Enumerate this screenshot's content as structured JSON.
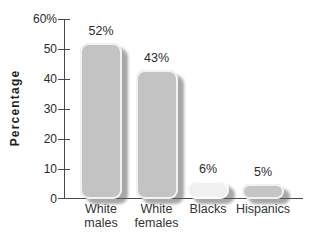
{
  "colors": {
    "background": "#ffffff",
    "bar_fill": "#c3c3c3",
    "bar_fill_light": "#f0f0f0",
    "axis": "#4a4a4a",
    "tick_text": "#2b2b2b",
    "value_text": "#2b2b2b",
    "category_text": "#333333"
  },
  "chart_data": {
    "type": "bar",
    "title": "",
    "xlabel": "",
    "ylabel": "Percentage",
    "categories": [
      "White males",
      "White females",
      "Blacks",
      "Hispanics"
    ],
    "values": [
      52,
      43,
      6,
      5
    ],
    "value_labels": [
      "52%",
      "43%",
      "6%",
      "5%"
    ],
    "ylim": [
      0,
      60
    ],
    "yticks": [
      {
        "value": 60,
        "label": "60%"
      },
      {
        "value": 50,
        "label": "50"
      },
      {
        "value": 40,
        "label": "40"
      },
      {
        "value": 30,
        "label": "30"
      },
      {
        "value": 20,
        "label": "20"
      },
      {
        "value": 10,
        "label": "10"
      },
      {
        "value": 0,
        "label": "0"
      }
    ],
    "grid": false,
    "legend": null,
    "bar_colors": [
      "#c3c3c3",
      "#c3c3c3",
      "#f0f0f0",
      "#c5c5c5"
    ]
  }
}
